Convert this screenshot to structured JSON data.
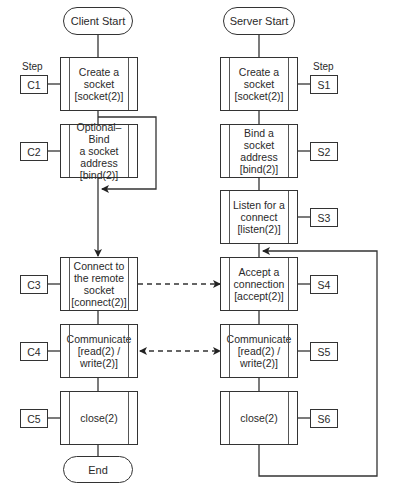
{
  "client": {
    "start": "Client Start",
    "end": "End",
    "step_heading": "Step",
    "steps": [
      {
        "id": "C1",
        "text": "Create a\nsocket\n[socket(2)]"
      },
      {
        "id": "C2",
        "text": "Optional–Bind\na socket\naddress\n[bind(2)]"
      },
      {
        "id": "C3",
        "text": "Connect to\nthe remote\nsocket\n[connect(2)]"
      },
      {
        "id": "C4",
        "text": "Communicate\n[read(2) /\nwrite(2)]"
      },
      {
        "id": "C5",
        "text": "close(2)"
      }
    ]
  },
  "server": {
    "start": "Server Start",
    "step_heading": "Step",
    "steps": [
      {
        "id": "S1",
        "text": "Create a\nsocket\n[socket(2)]"
      },
      {
        "id": "S2",
        "text": "Bind a socket\naddress\n[bind(2)]"
      },
      {
        "id": "S3",
        "text": "Listen for a\nconnect\n[listen(2)]"
      },
      {
        "id": "S4",
        "text": "Accept a\nconnection\n[accept(2)]"
      },
      {
        "id": "S5",
        "text": "Communicate\n[read(2) /\nwrite(2)]"
      },
      {
        "id": "S6",
        "text": "close(2)"
      }
    ]
  },
  "colors": {
    "line": "#333333",
    "background": "#ffffff"
  }
}
